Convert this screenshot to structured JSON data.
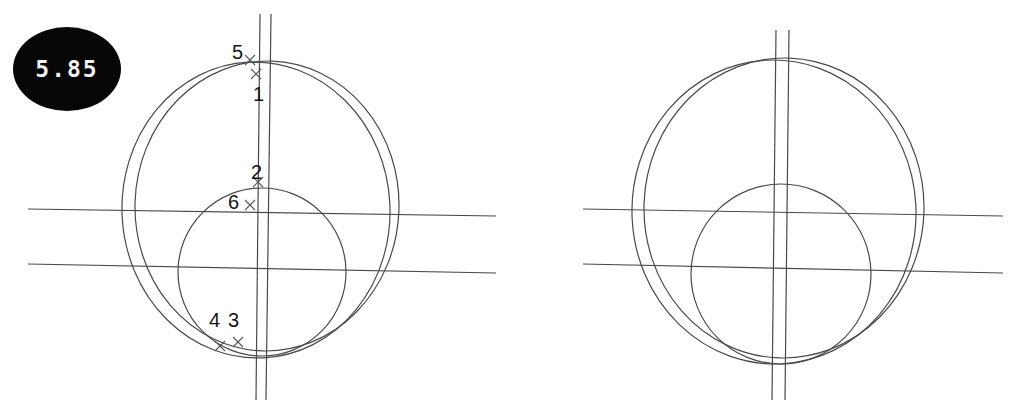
{
  "canvas": {
    "width": 1011,
    "height": 409,
    "background": "#ffffff"
  },
  "top_strip": {
    "text": ""
  },
  "panels": [
    {
      "id": "left",
      "badge": {
        "value": "5.85",
        "fill": "#060606",
        "text_color": "#f2f2f2"
      },
      "point_labels": [
        {
          "name": "5",
          "x": 232,
          "y": 42
        },
        {
          "name": "1",
          "x": 253,
          "y": 84
        },
        {
          "name": "2",
          "x": 251,
          "y": 162
        },
        {
          "name": "6",
          "x": 228,
          "y": 192
        },
        {
          "name": "4",
          "x": 209,
          "y": 310
        },
        {
          "name": "3",
          "x": 228,
          "y": 310
        }
      ],
      "markers": [
        {
          "name": "marker-5",
          "x": 250,
          "y": 60
        },
        {
          "name": "marker-1",
          "x": 256,
          "y": 74
        },
        {
          "name": "marker-2",
          "x": 258,
          "y": 182
        },
        {
          "name": "marker-6",
          "x": 250,
          "y": 205
        },
        {
          "name": "marker-4",
          "x": 220,
          "y": 346
        },
        {
          "name": "marker-3",
          "x": 238,
          "y": 342
        }
      ],
      "geometry": {
        "outer_circle_a": {
          "cx": 256,
          "cy": 210,
          "rx": 134,
          "ry": 148,
          "rot": -3
        },
        "outer_circle_b": {
          "cx": 267,
          "cy": 206,
          "rx": 132,
          "ry": 145,
          "rot": 2
        },
        "inner_circle": {
          "cx": 262,
          "cy": 272,
          "rx": 84,
          "ry": 84,
          "rot": 0
        },
        "vertical_lines": [
          {
            "x1": 260,
            "y1": 14,
            "x2": 256,
            "y2": 400
          },
          {
            "x1": 271,
            "y1": 14,
            "x2": 266,
            "y2": 400
          }
        ],
        "horizontal_lines": [
          {
            "x1": 28,
            "y1": 209,
            "x2": 496,
            "y2": 216
          },
          {
            "x1": 28,
            "y1": 264,
            "x2": 496,
            "y2": 273
          }
        ]
      }
    },
    {
      "id": "right",
      "badge": {
        "value": "5.86",
        "fill": "#060606",
        "text_color": "#f2f2f2"
      },
      "point_labels": [],
      "markers": [],
      "geometry": {
        "outer_circle_a": {
          "cx": 268,
          "cy": 212,
          "rx": 142,
          "ry": 152,
          "rot": -3
        },
        "outer_circle_b": {
          "cx": 278,
          "cy": 208,
          "rx": 140,
          "ry": 150,
          "rot": 2
        },
        "inner_circle": {
          "cx": 275,
          "cy": 274,
          "rx": 90,
          "ry": 90,
          "rot": 0
        },
        "vertical_lines": [
          {
            "x1": 270,
            "y1": 30,
            "x2": 266,
            "y2": 400
          },
          {
            "x1": 283,
            "y1": 30,
            "x2": 279,
            "y2": 400
          }
        ],
        "horizontal_lines": [
          {
            "x1": 77,
            "y1": 209,
            "x2": 497,
            "y2": 216
          },
          {
            "x1": 77,
            "y1": 264,
            "x2": 497,
            "y2": 273
          }
        ]
      }
    }
  ],
  "style": {
    "stroke_color": "#4a4a4a",
    "stroke_width": 1.2,
    "marker_color": "#555555"
  }
}
